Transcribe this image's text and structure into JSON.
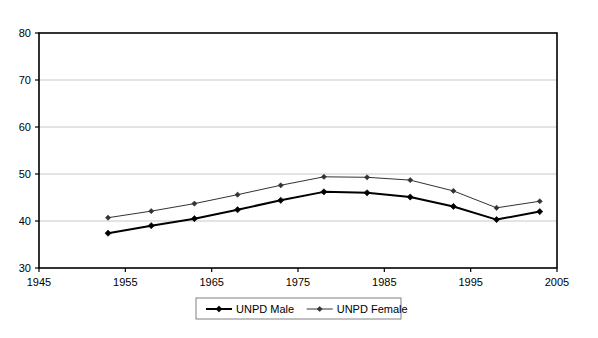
{
  "chart_data": {
    "type": "line",
    "title": "",
    "subtitle": "",
    "xlabel": "",
    "ylabel": "",
    "x": [
      1953,
      1958,
      1963,
      1968,
      1973,
      1978,
      1983,
      1988,
      1993,
      1998,
      2003
    ],
    "xlim": [
      1945,
      2005
    ],
    "ylim": [
      30,
      80
    ],
    "x_ticks": [
      1945,
      1955,
      1965,
      1975,
      1985,
      1995,
      2005
    ],
    "x_tick_labels": [
      "1945",
      "1955",
      "1965",
      "1975",
      "1985",
      "1995",
      "2005"
    ],
    "y_ticks": [
      30,
      40,
      50,
      60,
      70,
      80
    ],
    "y_tick_labels": [
      "30",
      "40",
      "50",
      "60",
      "70",
      "80"
    ],
    "grid": "horizontal",
    "grid_color": "#c8c8c8",
    "frame_color": "#000000",
    "plot_background": "#ffffff",
    "legend_position": "bottom-center",
    "marker": "diamond",
    "series": [
      {
        "name": "UNPD Male",
        "color": "#000000",
        "line_width": 2.0,
        "values": [
          37.4,
          39.0,
          40.5,
          42.4,
          44.4,
          46.2,
          46.0,
          45.1,
          43.1,
          40.3,
          42.0
        ]
      },
      {
        "name": "UNPD Female",
        "color": "#333333",
        "line_width": 1.0,
        "values": [
          40.7,
          42.1,
          43.7,
          45.6,
          47.6,
          49.4,
          49.3,
          48.7,
          46.4,
          42.8,
          44.2
        ]
      }
    ]
  },
  "legend": {
    "items": [
      {
        "label": "UNPD Male"
      },
      {
        "label": "UNPD Female"
      }
    ],
    "border_color": "#808080"
  }
}
